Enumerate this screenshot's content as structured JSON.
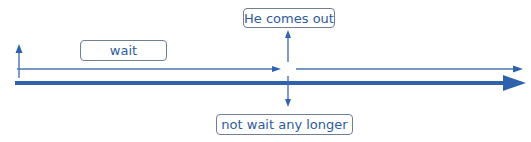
{
  "diagram": {
    "type": "timeline",
    "labels": {
      "wait": "wait",
      "event": "He comes out",
      "result": "not wait any longer"
    },
    "colors": {
      "line": "#2e62ad",
      "thin_line": "#4a74b3",
      "box_border": "#6f7f96",
      "text": "#2e5c9e"
    }
  }
}
